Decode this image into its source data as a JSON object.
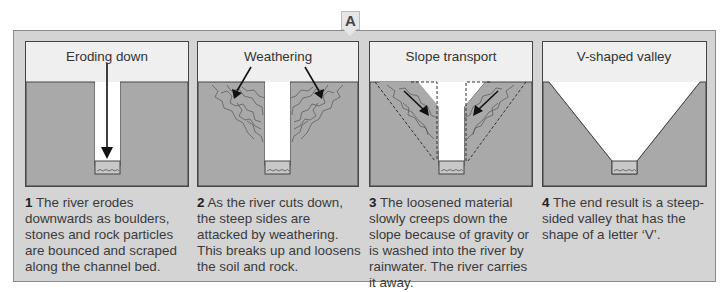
{
  "marker": {
    "label": "A"
  },
  "colors": {
    "frame_bg": "#d4d4d4",
    "sky": "#efefef",
    "rock": "#a9a9a9",
    "outline": "#444444"
  },
  "panels": [
    {
      "title": "Eroding down",
      "number": "1",
      "caption": "The river erodes downwards as boulders, stones and rock particles are bounced and scraped along the channel bed."
    },
    {
      "title": "Weathering",
      "number": "2",
      "caption": "As the river cuts down, the steep sides are attacked by weathering. This breaks up and loosens the soil and rock."
    },
    {
      "title": "Slope transport",
      "number": "3",
      "caption": "The loosened material slowly creeps down the slope because of gravity or is washed into the river by rainwater. The river carries it away."
    },
    {
      "title": "V-shaped valley",
      "number": "4",
      "caption": "The end result is a steep-sided valley that has the shape of a letter ‘V’."
    }
  ]
}
